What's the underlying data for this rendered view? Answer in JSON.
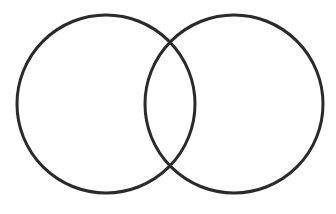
{
  "diagram": {
    "type": "venn",
    "sets": [
      {
        "id": "left",
        "label": "",
        "cx": 106,
        "cy": 104,
        "r": 89
      },
      {
        "id": "right",
        "label": "",
        "cx": 234,
        "cy": 104,
        "r": 89
      }
    ],
    "stroke_color": "#2a2a2a",
    "stroke_width": 3,
    "fill": "none",
    "background": "#ffffff"
  }
}
